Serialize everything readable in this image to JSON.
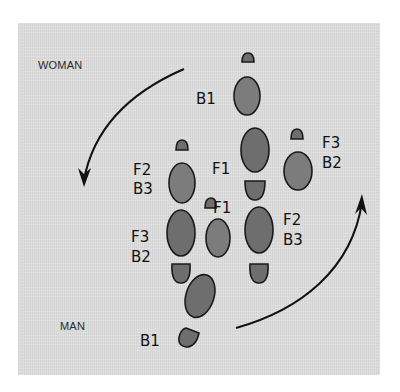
{
  "diagram": {
    "type": "dance-step-footprint-diagram",
    "labels": {
      "woman": "WOMAN",
      "man": "MAN"
    },
    "step_labels": [
      {
        "id": "woman-b1",
        "text": "B1",
        "x": 196,
        "y": 104
      },
      {
        "id": "woman-f1",
        "text": "F1",
        "x": 212,
        "y": 174
      },
      {
        "id": "woman-f3",
        "text": "F3",
        "x": 322,
        "y": 148
      },
      {
        "id": "woman-b2",
        "text": "B2",
        "x": 322,
        "y": 168
      },
      {
        "id": "left-f2",
        "text": "F2",
        "x": 133,
        "y": 175
      },
      {
        "id": "left-b3",
        "text": "B3",
        "x": 133,
        "y": 194
      },
      {
        "id": "man-f1",
        "text": "F1",
        "x": 213,
        "y": 213
      },
      {
        "id": "right-f2",
        "text": "F2",
        "x": 283,
        "y": 225
      },
      {
        "id": "right-b3",
        "text": "B3",
        "x": 283,
        "y": 245
      },
      {
        "id": "left-f3",
        "text": "F3",
        "x": 131,
        "y": 242
      },
      {
        "id": "left-b2",
        "text": "B2",
        "x": 131,
        "y": 262
      },
      {
        "id": "man-b1",
        "text": "B1",
        "x": 140,
        "y": 346
      }
    ],
    "colors": {
      "background": "#dcdcdc",
      "footprint": "#6e6e6e",
      "outline": "#1a1a1a",
      "text": "#111111"
    },
    "arrows": [
      {
        "id": "woman-rotation",
        "direction": "counterclockwise-down-left"
      },
      {
        "id": "man-rotation",
        "direction": "counterclockwise-up-right"
      }
    ]
  }
}
